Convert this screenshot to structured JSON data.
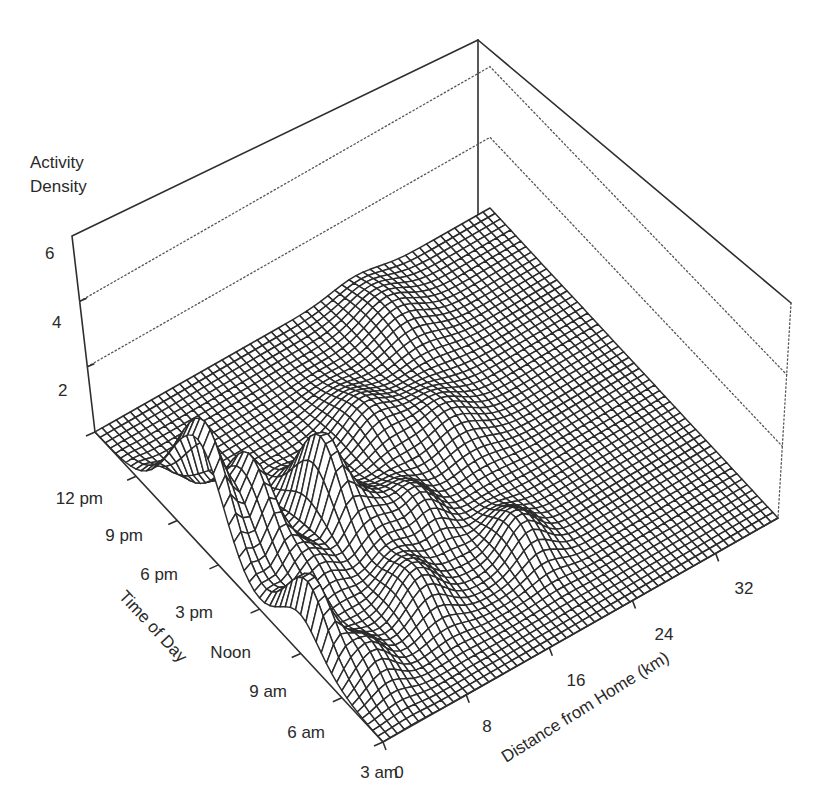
{
  "chart_data": {
    "type": "surface3d",
    "title": "",
    "zlabel_lines": [
      "Activity",
      "Density"
    ],
    "xlabel": "Distance from Home (km)",
    "ylabel": "Time of Day",
    "x_ticks": [
      "0",
      "8",
      "16",
      "24",
      "32"
    ],
    "x_range": [
      0,
      38
    ],
    "y_ticks": [
      "3 am",
      "6 am",
      "9 am",
      "Noon",
      "3 pm",
      "6 pm",
      "9 pm",
      "12 pm"
    ],
    "y_range_hours": [
      3,
      27
    ],
    "z_ticks": [
      "2",
      "4",
      "6"
    ],
    "z_range": [
      0,
      6
    ],
    "grid": true,
    "legend": "none",
    "surface_peaks": [
      {
        "distance_km": 1.0,
        "time": "10 am",
        "hour": 10.0,
        "density": 2.0,
        "spread_km": 0.9,
        "spread_h": 1.6
      },
      {
        "distance_km": 0.5,
        "time": "6:30 pm",
        "hour": 18.5,
        "density": 3.3,
        "spread_km": 1.0,
        "spread_h": 2.2
      },
      {
        "distance_km": 3.5,
        "time": "5 pm",
        "hour": 17.0,
        "density": 2.4,
        "spread_km": 1.1,
        "spread_h": 1.8
      },
      {
        "distance_km": 3.0,
        "time": "7 am",
        "hour": 7.0,
        "density": 0.9,
        "spread_km": 1.5,
        "spread_h": 1.5
      },
      {
        "distance_km": 5.0,
        "time": "1 pm",
        "hour": 13.0,
        "density": 0.8,
        "spread_km": 1.6,
        "spread_h": 1.6
      },
      {
        "distance_km": 9.0,
        "time": "4 pm",
        "hour": 16.0,
        "density": 2.2,
        "spread_km": 1.1,
        "spread_h": 1.6
      },
      {
        "distance_km": 11.0,
        "time": "2 pm",
        "hour": 14.0,
        "density": 1.0,
        "spread_km": 1.8,
        "spread_h": 2.0
      },
      {
        "distance_km": 10.0,
        "time": "9 am",
        "hour": 9.0,
        "density": 1.0,
        "spread_km": 1.8,
        "spread_h": 1.6
      },
      {
        "distance_km": 15.0,
        "time": "1 pm",
        "hour": 13.0,
        "density": 0.9,
        "spread_km": 1.5,
        "spread_h": 1.7
      },
      {
        "distance_km": 17.0,
        "time": "7 pm",
        "hour": 19.0,
        "density": 0.8,
        "spread_km": 2.0,
        "spread_h": 2.0
      },
      {
        "distance_km": 20.0,
        "time": "9 am",
        "hour": 9.0,
        "density": 0.9,
        "spread_km": 1.6,
        "spread_h": 1.5
      },
      {
        "distance_km": 22.0,
        "time": "5 pm",
        "hour": 17.0,
        "density": 0.7,
        "spread_km": 2.2,
        "spread_h": 2.0
      },
      {
        "distance_km": 25.0,
        "time": "12 pm (midnight)",
        "hour": 24.0,
        "density": 0.6,
        "spread_km": 2.2,
        "spread_h": 2.2
      }
    ]
  }
}
